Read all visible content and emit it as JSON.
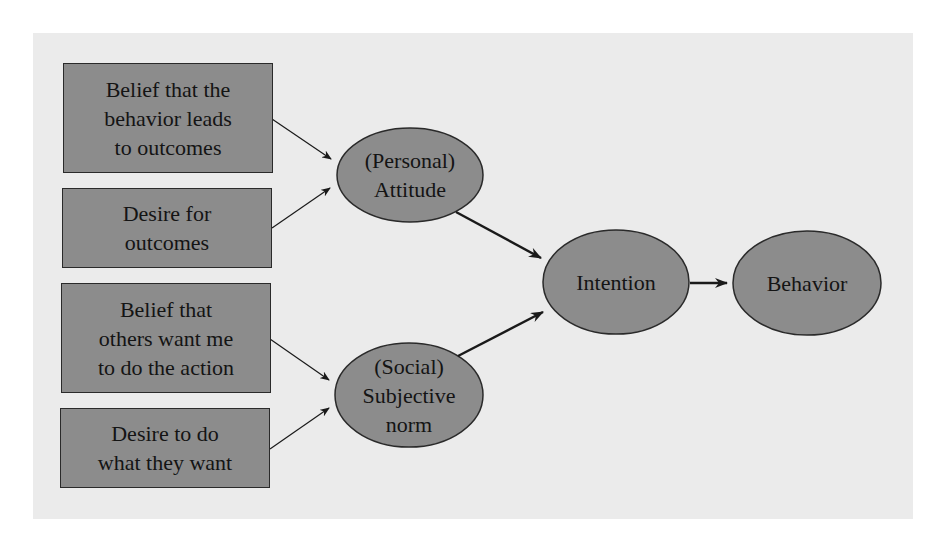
{
  "diagram": {
    "title": "",
    "type": "flow",
    "colors": {
      "panel_bg": "#ebebeb",
      "node_fill": "#8c8c8c",
      "node_stroke": "#2a2a2a",
      "edge": "#1a1a1a"
    },
    "boxes": [
      {
        "id": "belief_outcomes",
        "lines": [
          "Belief that the",
          "behavior leads",
          "to outcomes"
        ]
      },
      {
        "id": "desire_outcomes",
        "lines": [
          "Desire for",
          "outcomes"
        ]
      },
      {
        "id": "belief_others",
        "lines": [
          "Belief that",
          "others want me",
          "to do the action"
        ]
      },
      {
        "id": "desire_others",
        "lines": [
          "Desire to do",
          "what they want"
        ]
      }
    ],
    "ellipses": [
      {
        "id": "attitude",
        "lines": [
          "(Personal)",
          "Attitude"
        ]
      },
      {
        "id": "norm",
        "lines": [
          "(Social)",
          "Subjective",
          "norm"
        ]
      },
      {
        "id": "intention",
        "lines": [
          "Intention"
        ]
      },
      {
        "id": "behavior",
        "lines": [
          "Behavior"
        ]
      }
    ],
    "edges": [
      {
        "from": "belief_outcomes",
        "to": "attitude",
        "weight": "thin"
      },
      {
        "from": "desire_outcomes",
        "to": "attitude",
        "weight": "thin"
      },
      {
        "from": "belief_others",
        "to": "norm",
        "weight": "thin"
      },
      {
        "from": "desire_others",
        "to": "norm",
        "weight": "thin"
      },
      {
        "from": "attitude",
        "to": "intention",
        "weight": "thick"
      },
      {
        "from": "norm",
        "to": "intention",
        "weight": "thick"
      },
      {
        "from": "intention",
        "to": "behavior",
        "weight": "thick"
      }
    ]
  }
}
